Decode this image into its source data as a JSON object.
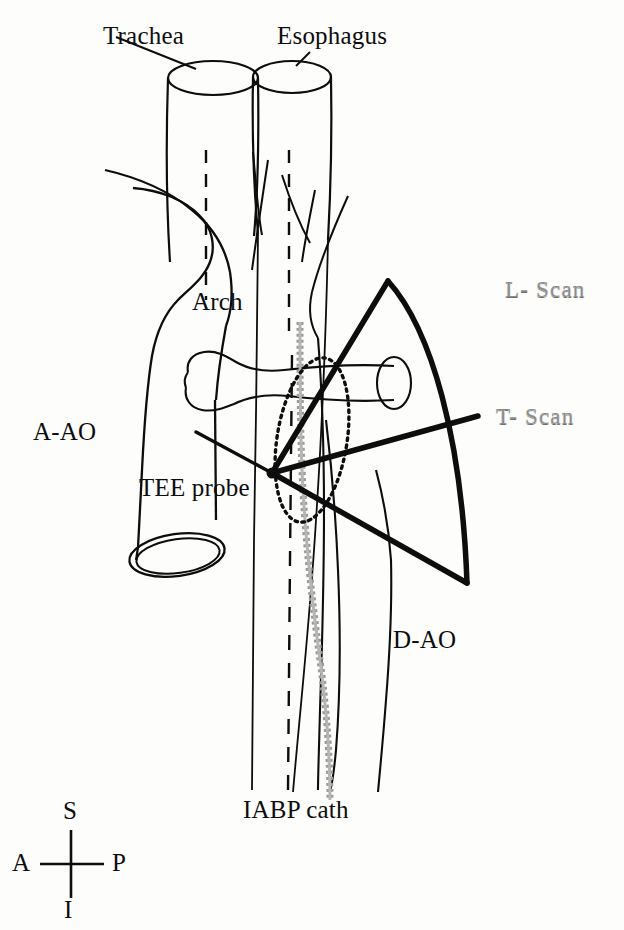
{
  "figure": {
    "background_color": "#fdfdfb",
    "ink_color": "#0d0d0d",
    "catheter_color": "#9a9a9a",
    "scan_label_color": "#8d8d8d"
  },
  "labels": {
    "trachea": "Trachea",
    "esophagus": "Esophagus",
    "arch": "Arch",
    "ascending_aorta": "A-AO",
    "descending_aorta": "D-AO",
    "tee_probe": "TEE probe",
    "iabp_catheter": "IABP cath",
    "longitudinal_scan": "L- Scan",
    "transverse_scan": "T- Scan"
  },
  "orientation_compass": {
    "superior": "S",
    "inferior": "I",
    "anterior": "A",
    "posterior": "P"
  },
  "structures": [
    {
      "name": "trachea",
      "kind": "cylinder"
    },
    {
      "name": "esophagus",
      "kind": "cylinder"
    },
    {
      "name": "aortic-arch",
      "kind": "outline"
    },
    {
      "name": "ascending-aorta",
      "kind": "outline"
    },
    {
      "name": "descending-aorta",
      "kind": "outline"
    },
    {
      "name": "right-pulmonary-artery",
      "kind": "cylinder"
    },
    {
      "name": "arch-branch-vessels",
      "kind": "lines"
    },
    {
      "name": "iabp-catheter",
      "kind": "dotted-stripe"
    },
    {
      "name": "transverse-scan-plane",
      "kind": "dotted-ellipse"
    },
    {
      "name": "longitudinal-scan-sector",
      "kind": "sector"
    },
    {
      "name": "transverse-scan-line",
      "kind": "line"
    }
  ]
}
